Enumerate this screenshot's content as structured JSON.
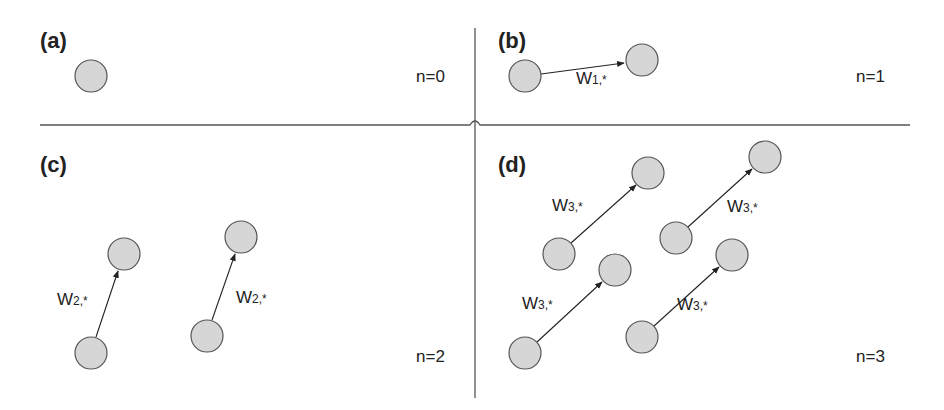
{
  "figure": {
    "colors": {
      "node_fill": "#d6d6d6",
      "node_stroke": "#555555",
      "line": "#222222",
      "divider": "#555555"
    },
    "panels": [
      {
        "id": "a",
        "label": "(a)",
        "n_label": "n=0",
        "nodes": [
          {
            "x": 91,
            "y": 76
          }
        ],
        "edges": []
      },
      {
        "id": "b",
        "label": "(b)",
        "n_label": "n=1",
        "nodes": [
          {
            "x": 525,
            "y": 76
          },
          {
            "x": 642,
            "y": 60
          }
        ],
        "edges": [
          {
            "from": 0,
            "to": 1,
            "label_main": "W",
            "label_sub": "1,*"
          }
        ]
      },
      {
        "id": "c",
        "label": "(c)",
        "n_label": "n=2",
        "nodes": [
          {
            "x": 91,
            "y": 353
          },
          {
            "x": 124,
            "y": 254
          },
          {
            "x": 207,
            "y": 336
          },
          {
            "x": 241,
            "y": 237
          }
        ],
        "edges": [
          {
            "from": 0,
            "to": 1,
            "label_main": "W",
            "label_sub": "2,*"
          },
          {
            "from": 2,
            "to": 3,
            "label_main": "W",
            "label_sub": "2,*"
          }
        ]
      },
      {
        "id": "d",
        "label": "(d)",
        "n_label": "n=3",
        "nodes": [
          {
            "x": 559,
            "y": 254
          },
          {
            "x": 648,
            "y": 173
          },
          {
            "x": 676,
            "y": 238
          },
          {
            "x": 765,
            "y": 157
          },
          {
            "x": 525,
            "y": 353
          },
          {
            "x": 615,
            "y": 270
          },
          {
            "x": 642,
            "y": 337
          },
          {
            "x": 732,
            "y": 255
          }
        ],
        "edges": [
          {
            "from": 0,
            "to": 1,
            "label_main": "W",
            "label_sub": "3,*"
          },
          {
            "from": 2,
            "to": 3,
            "label_main": "W",
            "label_sub": "3,*"
          },
          {
            "from": 4,
            "to": 5,
            "label_main": "W",
            "label_sub": "3,*"
          },
          {
            "from": 6,
            "to": 7,
            "label_main": "W",
            "label_sub": "3,*"
          }
        ]
      }
    ]
  }
}
